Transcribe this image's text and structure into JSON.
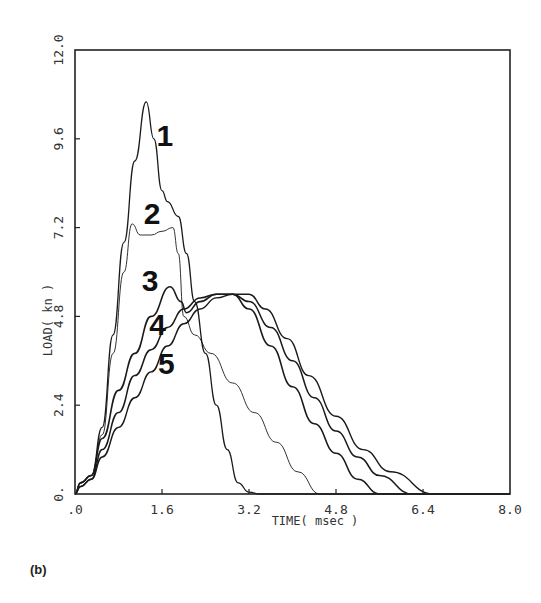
{
  "chart_data": {
    "type": "line",
    "title": "",
    "xlabel": "TIME( msec )",
    "ylabel": "LOAD( kn )",
    "xlim": [
      0,
      8.0
    ],
    "ylim": [
      0,
      12.0
    ],
    "x_ticks": [
      ".0",
      "1.6",
      "3.2",
      "4.8",
      "6.4",
      "8.0"
    ],
    "y_ticks": [
      "0.",
      "2.4",
      "4.8",
      "7.2",
      "9.6",
      "12.0"
    ],
    "grid": false,
    "legend": "inline numeric labels next to curves",
    "series": [
      {
        "name": "1",
        "x": [
          0,
          0.1,
          0.3,
          0.5,
          0.7,
          0.9,
          1.1,
          1.31,
          1.45,
          1.6,
          1.7,
          1.9,
          2.05,
          2.2,
          2.4,
          2.6,
          2.8,
          3.0,
          3.2,
          3.4,
          8.0
        ],
        "values": [
          0,
          0.3,
          0.5,
          1.8,
          4.3,
          6.8,
          9.0,
          10.6,
          9.6,
          8.2,
          7.9,
          7.5,
          6.5,
          5.2,
          3.8,
          2.4,
          1.2,
          0.3,
          0.05,
          0,
          0
        ]
      },
      {
        "name": "2",
        "x": [
          0,
          0.1,
          0.3,
          0.5,
          0.7,
          0.9,
          1.05,
          1.2,
          1.4,
          1.6,
          1.8,
          1.9,
          2.0,
          2.2,
          2.5,
          2.9,
          3.3,
          3.7,
          4.1,
          4.5,
          8.0
        ],
        "values": [
          0,
          0.3,
          0.5,
          1.6,
          3.8,
          6.0,
          7.3,
          7.0,
          7.0,
          7.1,
          7.2,
          6.5,
          4.8,
          4.3,
          3.8,
          3.0,
          2.2,
          1.4,
          0.6,
          0,
          0
        ]
      },
      {
        "name": "3",
        "x": [
          0,
          0.1,
          0.3,
          0.5,
          0.8,
          1.1,
          1.4,
          1.75,
          1.95,
          2.05,
          2.3,
          2.6,
          2.9,
          3.2,
          3.6,
          4.0,
          4.4,
          4.8,
          5.2,
          5.6,
          8.0
        ],
        "values": [
          0,
          0.3,
          0.5,
          1.5,
          2.8,
          3.8,
          4.8,
          5.6,
          5.2,
          4.9,
          5.2,
          5.4,
          5.4,
          5.0,
          4.0,
          2.9,
          1.9,
          1.1,
          0.4,
          0,
          0
        ]
      },
      {
        "name": "4",
        "x": [
          0,
          0.1,
          0.3,
          0.5,
          0.8,
          1.1,
          1.4,
          1.7,
          2.0,
          2.3,
          2.6,
          2.9,
          3.2,
          3.6,
          4.0,
          4.4,
          4.8,
          5.2,
          5.6,
          6.2,
          8.0
        ],
        "values": [
          0,
          0.2,
          0.4,
          1.2,
          2.2,
          3.2,
          3.9,
          4.5,
          5.0,
          5.3,
          5.4,
          5.4,
          5.2,
          4.5,
          3.6,
          2.6,
          1.7,
          1.0,
          0.5,
          0,
          0
        ]
      },
      {
        "name": "5",
        "x": [
          0,
          0.1,
          0.3,
          0.5,
          0.8,
          1.1,
          1.4,
          1.7,
          2.0,
          2.3,
          2.6,
          2.9,
          3.2,
          3.5,
          3.9,
          4.3,
          4.8,
          5.3,
          5.8,
          6.6,
          8.0
        ],
        "values": [
          0,
          0.2,
          0.4,
          1.0,
          1.8,
          2.6,
          3.3,
          4.0,
          4.6,
          5.0,
          5.3,
          5.4,
          5.4,
          5.0,
          4.2,
          3.2,
          2.1,
          1.2,
          0.6,
          0,
          0
        ]
      }
    ],
    "annotations": [
      {
        "text": "1",
        "x": 1.65,
        "y": 9.4
      },
      {
        "text": "2",
        "x": 1.42,
        "y": 7.3
      },
      {
        "text": "3",
        "x": 1.38,
        "y": 5.5
      },
      {
        "text": "4",
        "x": 1.52,
        "y": 4.3
      },
      {
        "text": "5",
        "x": 1.68,
        "y": 3.25
      }
    ]
  },
  "caption": "(b)"
}
